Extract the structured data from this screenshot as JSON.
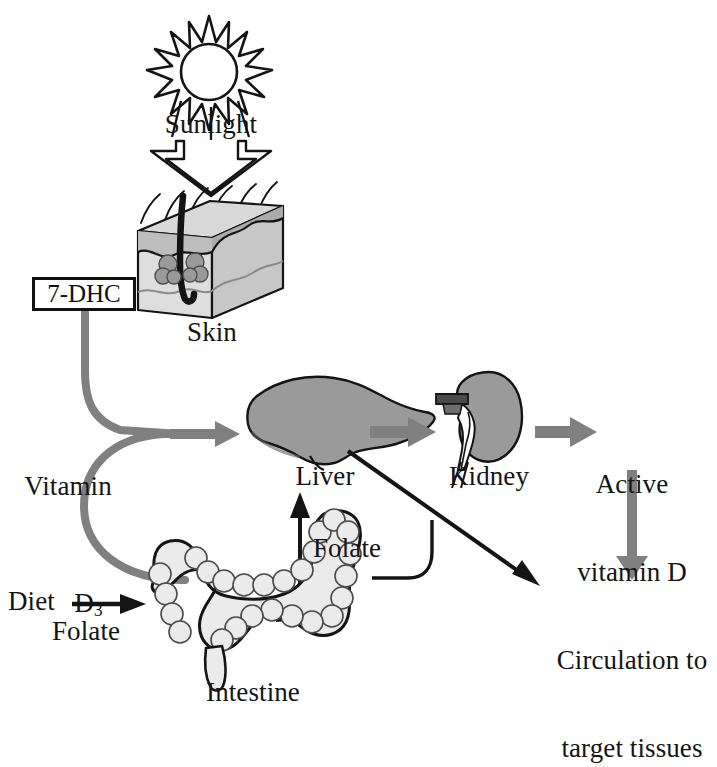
{
  "diagram": {
    "colors": {
      "ink": "#141414",
      "gray_arrow": "#808080",
      "organ_gray": "#9a9a9a",
      "skin_light": "#d9d9d9",
      "skin_mid": "#c2c2c2",
      "intestine_fill": "#ebebeb"
    },
    "labels": {
      "sunlight": "Sunlight",
      "seven_dhc": "7-DHC",
      "skin": "Skin",
      "vitamin_d3_line1": "Vitamin",
      "vitamin_d3_line2_main": "D",
      "vitamin_d3_line2_sub": "3",
      "liver": "Liver",
      "kidney": "Kidney",
      "active_vitamin_d_line1": "Active",
      "active_vitamin_d_line2": "vitamin D",
      "circulation_line1": "Circulation to",
      "circulation_line2": "target tissues",
      "folate_liver": "Folate",
      "folate_right": "Folate",
      "diet": "Diet",
      "folate_diet": "Folate",
      "intestine": "Intestine"
    },
    "icons": {
      "sun": "sun-icon",
      "sunlight_arrow": "down-block-arrow-icon",
      "skin_block": "skin-cross-section-icon",
      "liver": "liver-organ-icon",
      "kidney": "kidney-organ-icon",
      "intestine": "intestine-organ-icon",
      "arrow_d3_to_liver": "gray-arrow-icon",
      "arrow_liver_to_kidney": "gray-arrow-icon",
      "arrow_kidney_to_active": "gray-arrow-icon",
      "arrow_active_to_circulation": "gray-down-arrow-icon",
      "arrow_liver_to_circulation": "black-diagonal-arrow-icon",
      "arrow_intestine_to_liver": "black-curved-arrow-icon",
      "arrow_diet_to_intestine": "black-arrow-icon",
      "path_dhc_to_liver": "gray-curved-path-icon",
      "path_intestine_to_liver": "gray-curved-path-icon",
      "path_folate_right": "black-curved-path-icon"
    }
  }
}
